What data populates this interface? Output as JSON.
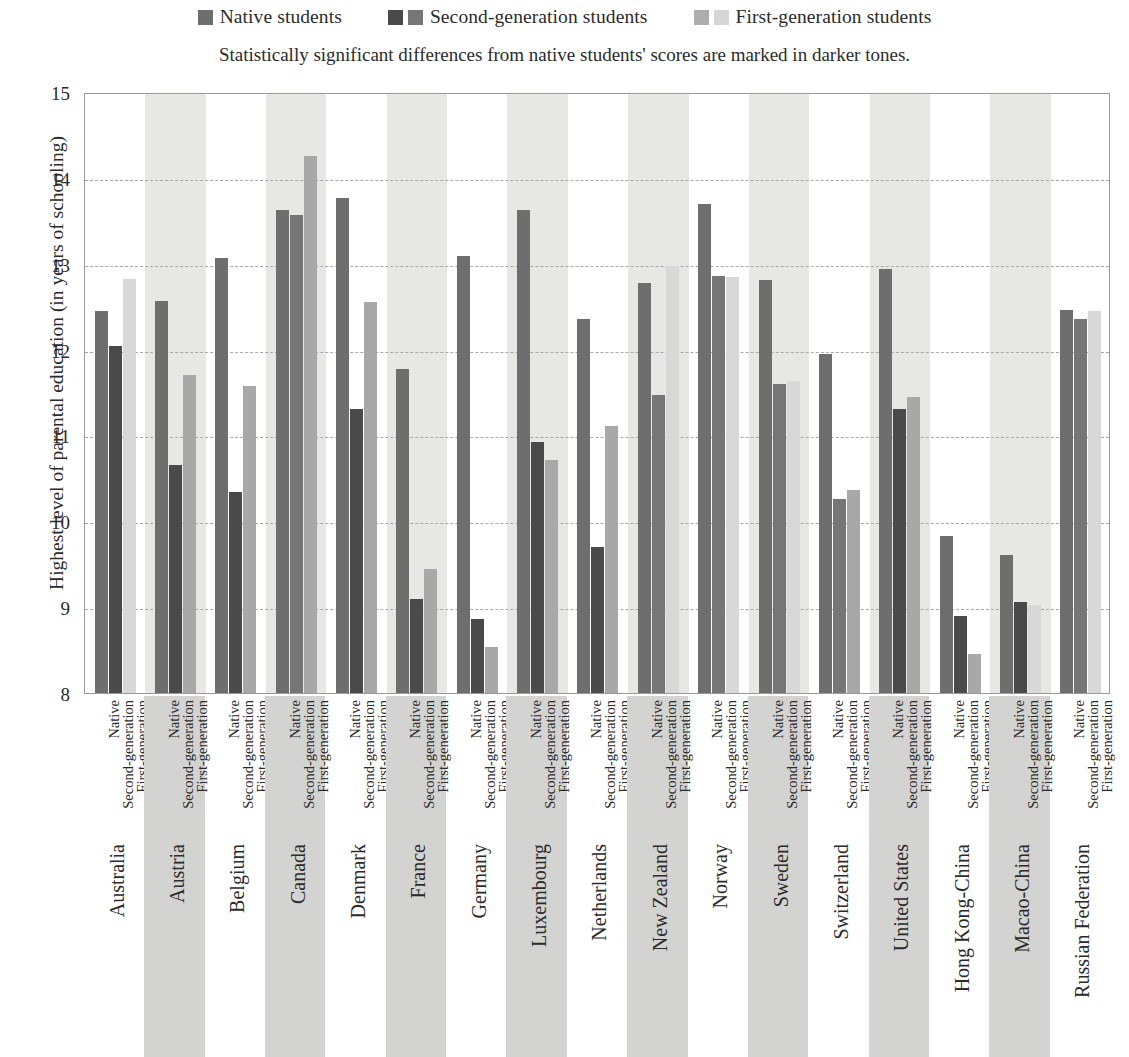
{
  "legend": {
    "items": [
      {
        "label": "Native students",
        "swatches": [
          "#6e6e6e"
        ]
      },
      {
        "label": "Second-generation students",
        "swatches": [
          "#4a4a4a",
          "#767676"
        ]
      },
      {
        "label": "First-generation students",
        "swatches": [
          "#adadad",
          "#d6d6d6"
        ]
      }
    ]
  },
  "subtitle": "Statistically significant differences from native students' scores are marked in darker tones.",
  "colors": {
    "native": "#6e6e6e",
    "second_significant": "#4a4a4a",
    "second_not_significant": "#767676",
    "first_significant": "#a8a8a8",
    "first_not_significant": "#d8d8d8",
    "band": "#e7e7e4",
    "label_band": "#d3d3d1",
    "gridline": "#a9a9a9",
    "frame": "#9a9a9a"
  },
  "axis": {
    "ylabel": "Highest level of parental education (in years of schooling)",
    "yticks": [
      8,
      9,
      10,
      11,
      12,
      13,
      14,
      15
    ],
    "ymin": 8,
    "ymax": 15,
    "series_labels": [
      "Native",
      "Second-generation",
      "First-generation"
    ]
  },
  "chart_data": {
    "type": "bar",
    "title": "",
    "subtitle": "Statistically significant differences from native students' scores are marked in darker tones.",
    "xlabel": "",
    "ylabel": "Highest level of parental education (in years of schooling)",
    "ylim": [
      8,
      15
    ],
    "ytick_step": 1,
    "grid": true,
    "legend_position": "top",
    "categories": [
      "Australia",
      "Austria",
      "Belgium",
      "Canada",
      "Denmark",
      "France",
      "Germany",
      "Luxembourg",
      "Netherlands",
      "New Zealand",
      "Norway",
      "Sweden",
      "Switzerland",
      "United States",
      "Hong Kong-China",
      "Macao-China",
      "Russian Federation"
    ],
    "series": [
      {
        "name": "Native students",
        "values": [
          12.45,
          12.57,
          13.07,
          13.62,
          13.76,
          11.77,
          13.09,
          13.62,
          12.36,
          12.78,
          13.7,
          12.81,
          11.95,
          12.94,
          9.83,
          9.61,
          12.46
        ]
      },
      {
        "name": "Second-generation students",
        "values": [
          12.04,
          10.66,
          10.34,
          13.57,
          11.31,
          9.1,
          8.86,
          10.92,
          9.7,
          11.47,
          12.86,
          11.6,
          10.26,
          11.31,
          8.9,
          9.06,
          12.36
        ],
        "significant": [
          true,
          true,
          true,
          false,
          true,
          true,
          true,
          true,
          true,
          false,
          false,
          false,
          false,
          true,
          true,
          true,
          false
        ]
      },
      {
        "name": "First-generation students",
        "values": [
          12.82,
          11.7,
          11.58,
          14.25,
          12.56,
          9.45,
          8.54,
          10.71,
          11.11,
          12.97,
          12.84,
          11.63,
          10.37,
          11.45,
          8.45,
          9.03,
          12.45
        ],
        "significant": [
          false,
          true,
          true,
          true,
          true,
          true,
          true,
          true,
          true,
          false,
          false,
          false,
          true,
          true,
          true,
          false,
          false
        ]
      }
    ]
  }
}
